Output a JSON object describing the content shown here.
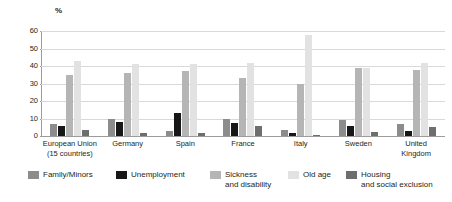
{
  "chart_data": {
    "type": "bar",
    "title": "",
    "subtitle": "",
    "xlabel": "",
    "ylabel": "%",
    "ylim": [
      0,
      60
    ],
    "yticks": [
      0,
      10,
      20,
      30,
      40,
      50,
      60
    ],
    "ytick_labels": [
      "0",
      "10",
      "20",
      "30",
      "40",
      "50",
      "60"
    ],
    "grid": true,
    "legend_position": "bottom",
    "categories": [
      "European Union\n(15 countries)",
      "Germany",
      "Spain",
      "France",
      "Italy",
      "Sweden",
      "United\nKingdom"
    ],
    "series": [
      {
        "name": "Family/Minors",
        "color": "#8c8c8c",
        "values": [
          7,
          10,
          3,
          9.5,
          3.5,
          9,
          7
        ]
      },
      {
        "name": "Unemployment",
        "color": "#171717",
        "values": [
          6,
          8,
          13,
          7.5,
          2,
          5.5,
          3
        ]
      },
      {
        "name": "Sickness\nand disability",
        "color": "#b5b5b5",
        "values": [
          35,
          36,
          37,
          33,
          30,
          39,
          38
        ]
      },
      {
        "name": "Old age",
        "color": "#e2e2e2",
        "values": [
          43,
          41,
          41,
          42,
          58,
          39,
          42
        ]
      },
      {
        "name": "Housing\nand social exclusion",
        "color": "#6e6e6e",
        "values": [
          3.5,
          2,
          2,
          6,
          0.5,
          2.5,
          5
        ]
      }
    ]
  },
  "legend": {
    "items": [
      {
        "label": "Family/Minors",
        "color": "#8c8c8c",
        "icon": "legend-swatch-icon"
      },
      {
        "label": "Unemployment",
        "color": "#171717",
        "icon": "legend-swatch-icon"
      },
      {
        "label": "Sickness\nand disability",
        "color": "#b5b5b5",
        "icon": "legend-swatch-icon"
      },
      {
        "label": "Old age",
        "color": "#e2e2e2",
        "icon": "legend-swatch-icon"
      },
      {
        "label": "Housing\nand social exclusion",
        "color": "#6e6e6e",
        "icon": "legend-swatch-icon"
      }
    ]
  },
  "axis": {
    "unit_label": "%"
  }
}
